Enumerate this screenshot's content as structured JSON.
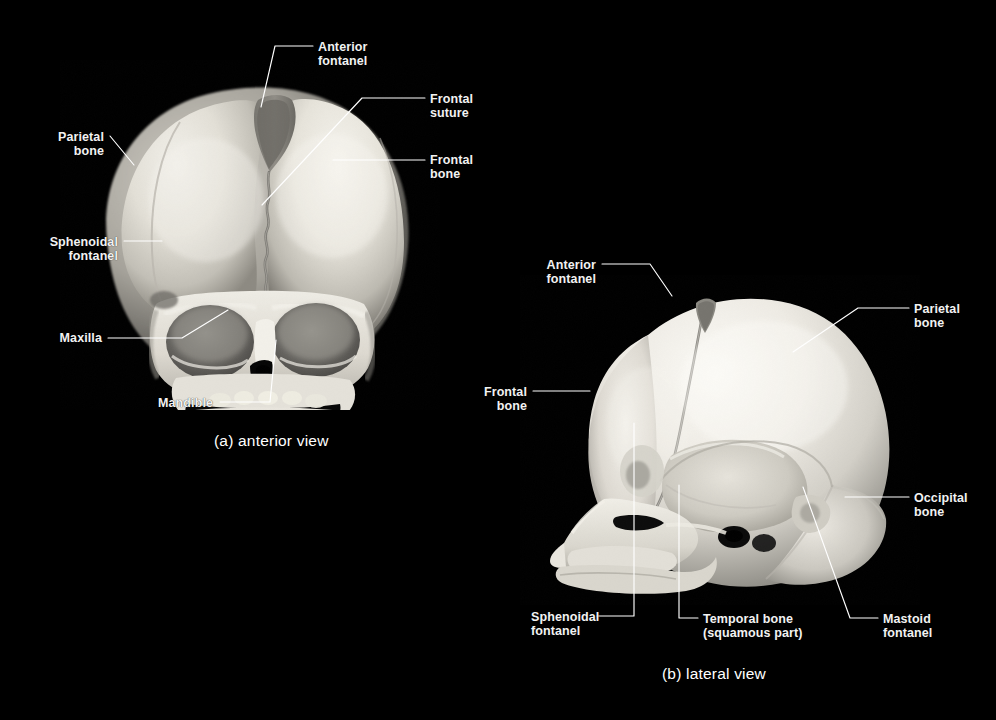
{
  "figure": {
    "background_color": "#000000",
    "label_color": "#f2f2f2",
    "leader_color": "#ffffff",
    "leader_color_dark": "#111111",
    "bone_color": "#d8d6d0",
    "type": "anatomical-photograph-figure"
  },
  "panels": [
    {
      "id": "a",
      "caption": "(a) anterior view",
      "caption_x": 214,
      "caption_y": 432,
      "labels": [
        {
          "id": "a-anterior-fontanel",
          "text": "Anterior\nfontanel",
          "x": 318,
          "y": 41,
          "align": "left"
        },
        {
          "id": "a-frontal-suture",
          "text": "Frontal\nsuture",
          "x": 430,
          "y": 93,
          "align": "left"
        },
        {
          "id": "a-frontal-bone",
          "text": "Frontal\nbone",
          "x": 430,
          "y": 154,
          "align": "left"
        },
        {
          "id": "a-parietal-bone",
          "text": "Parietal\nbone",
          "x": 104,
          "y": 131,
          "align": "right"
        },
        {
          "id": "a-sphenoidal-fontanel",
          "text": "Sphenoidal\nfontanel",
          "x": 118,
          "y": 236,
          "align": "right"
        },
        {
          "id": "a-maxilla",
          "text": "Maxilla",
          "x": 102,
          "y": 332,
          "align": "right"
        },
        {
          "id": "a-mandible",
          "text": "Mandible",
          "x": 213,
          "y": 397,
          "align": "right"
        }
      ]
    },
    {
      "id": "b",
      "caption": "(b) lateral view",
      "caption_x": 662,
      "caption_y": 665,
      "labels": [
        {
          "id": "b-anterior-fontanel",
          "text": "Anterior\nfontanel",
          "x": 596,
          "y": 259,
          "align": "right"
        },
        {
          "id": "b-parietal-bone",
          "text": "Parietal\nbone",
          "x": 914,
          "y": 303,
          "align": "left"
        },
        {
          "id": "b-occipital-bone",
          "text": "Occipital\nbone",
          "x": 914,
          "y": 492,
          "align": "left"
        },
        {
          "id": "b-frontal-bone",
          "text": "Frontal\nbone",
          "x": 527,
          "y": 386,
          "align": "right"
        },
        {
          "id": "b-sphenoidal-fontanel",
          "text": "Sphenoidal\nfontanel",
          "x": 531,
          "y": 611,
          "align": "left"
        },
        {
          "id": "b-temporal-bone",
          "text": "Temporal bone\n(squamous part)",
          "x": 703,
          "y": 613,
          "align": "left"
        },
        {
          "id": "b-mastoid-fontanel",
          "text": "Mastoid\nfontanel",
          "x": 883,
          "y": 613,
          "align": "left"
        }
      ]
    }
  ],
  "leaders": [
    {
      "id": "leader-a-anterior-fontanel",
      "points": "313,46 275,46 261,107"
    },
    {
      "id": "leader-a-frontal-suture",
      "points": "425,98 362,98 262,205"
    },
    {
      "id": "leader-a-frontal-bone",
      "points": "425,160 333,160"
    },
    {
      "id": "leader-a-parietal-bone",
      "points": "110,136 134,165"
    },
    {
      "id": "leader-a-sphenoidal-fontanel",
      "points": "124,241 162,241"
    },
    {
      "id": "leader-a-maxilla",
      "points": "108,338 182,338 228,310"
    },
    {
      "id": "leader-a-mandible",
      "points": "220,402 270,402 276,340"
    },
    {
      "id": "leader-b-anterior-fontanel",
      "points": "602,264 650,264 672,296"
    },
    {
      "id": "leader-b-parietal-bone",
      "points": "909,308 858,308 793,352"
    },
    {
      "id": "leader-b-occipital-bone",
      "points": "909,497 845,497"
    },
    {
      "id": "leader-b-frontal-bone",
      "points": "533,391 590,391"
    },
    {
      "id": "leader-b-sphenoidal-fontanel",
      "points": "597,616 634,616 634,423"
    },
    {
      "id": "leader-b-temporal-bone",
      "points": "698,618 679,618 679,485"
    },
    {
      "id": "leader-b-mastoid-fontanel",
      "points": "878,618 850,618 803,487"
    }
  ]
}
